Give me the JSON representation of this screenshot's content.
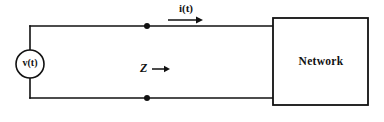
{
  "diagram": {
    "background_color": "#ffffff",
    "line_color": "#111111",
    "labels": {
      "current": "i(t)",
      "impedance": "Z",
      "source": "v(t)",
      "network": "Network"
    },
    "icons": {
      "current_arrow": "arrow-right-icon",
      "impedance_arrow": "arrow-right-icon",
      "source_symbol": "voltage-source-circle-icon",
      "top_terminal": "terminal-node-dot-icon",
      "bottom_terminal": "terminal-node-dot-icon"
    },
    "components": [
      {
        "name": "voltage-source",
        "label": "v(t)",
        "type": "independent-voltage-source"
      },
      {
        "name": "network-block",
        "label": "Network",
        "type": "two-terminal-black-box"
      }
    ],
    "annotations": [
      {
        "name": "current-annotation",
        "text": "i(t)",
        "direction": "right"
      },
      {
        "name": "impedance-annotation",
        "text": "Z",
        "direction": "right"
      }
    ]
  }
}
